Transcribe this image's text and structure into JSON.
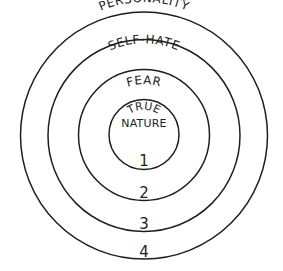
{
  "diagram": {
    "type": "concentric-circles",
    "stroke_color": "#1e1e1e",
    "background": "#ffffff",
    "layers": [
      {
        "number": "1",
        "label_lines": [
          "TRUE",
          "NATURE"
        ]
      },
      {
        "number": "2",
        "label": "FEAR"
      },
      {
        "number": "3",
        "label": "SELF-HATE"
      },
      {
        "number": "4",
        "label": "PERSONALITY"
      }
    ]
  }
}
